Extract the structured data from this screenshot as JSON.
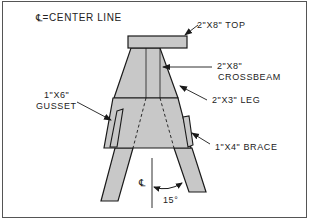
{
  "diagram": {
    "legend": {
      "symbol": "℄",
      "text": "=CENTER LINE"
    },
    "labels": {
      "top": "2\"X8\" TOP",
      "crossbeam_line1": "2\"X8\"",
      "crossbeam_line2": "CROSSBEAM",
      "leg": "2\"X3\" LEG",
      "gusset_line1": "1\"X6\"",
      "gusset_line2": "GUSSET",
      "brace": "1\"X4\" BRACE",
      "centerline_mark": "℄",
      "angle": "15°"
    },
    "colors": {
      "fill": "#c8c8c8",
      "stroke": "#1a1a1a",
      "border": "#555555",
      "background": "#ffffff"
    }
  }
}
